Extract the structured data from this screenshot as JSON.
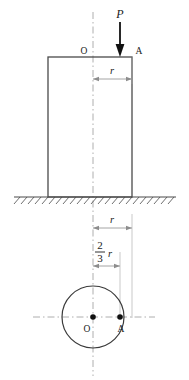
{
  "figure": {
    "type": "engineering-diagram",
    "labels": {
      "load": "P",
      "center_point": "O",
      "offset_point": "A",
      "radius_upper": "r",
      "radius_lower": "r",
      "eccentricity_numerator": "2",
      "eccentricity_denominator": "3",
      "eccentricity_variable": "r"
    },
    "colors": {
      "stroke": "#4d4d4d",
      "outline": "#3a3a3a",
      "text": "#1a1a1a",
      "centerline": "#8a8a8a",
      "arrow": "#111111",
      "background": "#ffffff"
    },
    "geometry": {
      "column_left": 48,
      "column_right": 132,
      "column_top": 57,
      "column_bottom": 197,
      "centerline_x": 93,
      "ground_y": 197,
      "ground_left": 14,
      "ground_right": 176,
      "circle_cx": 93,
      "circle_cy": 317,
      "circle_r": 31,
      "point_a_x": 120,
      "dim_r_upper_y": 79,
      "dim_r_lower_y": 228,
      "dim_frac_y": 266
    }
  }
}
